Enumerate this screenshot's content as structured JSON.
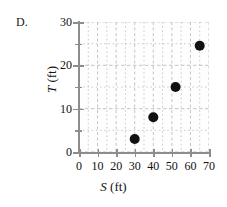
{
  "panel": {
    "label": "D."
  },
  "axis_titles": {
    "x_variable": "S",
    "x_units": " (ft)",
    "y_variable": "T",
    "y_units": " (ft)"
  },
  "ticks": {
    "x_labels": [
      "0",
      "10",
      "20",
      "30",
      "40",
      "50",
      "60",
      "70"
    ],
    "y_labels": [
      "0",
      "10",
      "20",
      "30"
    ]
  },
  "colors": {
    "marker": "#111111",
    "axis": "#8d8d8d",
    "gridline": "#b9b9b9",
    "background": "#ffffff"
  },
  "chart_data": {
    "type": "scatter",
    "title": "D.",
    "xlabel": "S (ft)",
    "ylabel": "T (ft)",
    "xlim": [
      0,
      70
    ],
    "ylim": [
      0,
      30
    ],
    "xticks": [
      0,
      10,
      20,
      30,
      40,
      50,
      60,
      70
    ],
    "yticks": [
      0,
      10,
      20,
      30
    ],
    "x_minor_tick_step": 5,
    "y_minor_tick_step": 5,
    "grid": true,
    "grid_style": "dashed",
    "grid_minor_step_x": 5,
    "grid_minor_step_y": 5,
    "legend": null,
    "series": [
      {
        "name": "observations",
        "marker": "filled-circle",
        "points": [
          {
            "x": 30,
            "y": 3
          },
          {
            "x": 40,
            "y": 8
          },
          {
            "x": 52,
            "y": 15
          },
          {
            "x": 65,
            "y": 24.5
          }
        ]
      }
    ]
  }
}
